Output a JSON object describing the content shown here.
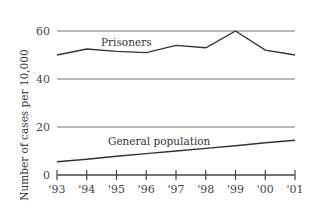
{
  "chart_data": {
    "type": "line",
    "title": "",
    "xlabel": "",
    "ylabel": "Number of cases per 10,000",
    "categories": [
      "'93",
      "'94",
      "'95",
      "'96",
      "'97",
      "'98",
      "'99",
      "'00",
      "'01"
    ],
    "series": [
      {
        "name": "Prisoners",
        "values": [
          50,
          52.5,
          51.5,
          51,
          54,
          53,
          60,
          52,
          50
        ]
      },
      {
        "name": "General population",
        "values": [
          5.5,
          6.6,
          7.8,
          8.9,
          10,
          11.1,
          12.2,
          13.4,
          14.5
        ]
      }
    ],
    "yticks": [
      0,
      20,
      40,
      60
    ],
    "ylim": [
      0,
      60
    ],
    "grid": true,
    "legend": "inline labels"
  },
  "labels": {
    "ylabel": "Number of cases per 10,000",
    "prisoners": "Prisoners",
    "general": "General population",
    "y0": "0",
    "y20": "20",
    "y40": "40",
    "y60": "60",
    "x": [
      "'93",
      "'94",
      "'95",
      "'96",
      "'97",
      "'98",
      "'99",
      "'00",
      "'01"
    ]
  }
}
